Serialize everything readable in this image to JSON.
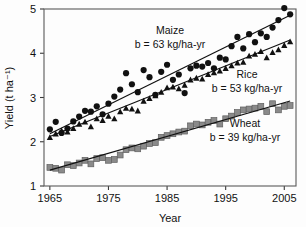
{
  "chart_data": {
    "type": "scatter",
    "title": "",
    "xlabel": "Year",
    "ylabel": "Yield (t ha⁻¹)",
    "xlim": [
      1964,
      2007
    ],
    "ylim": [
      1,
      5
    ],
    "xticks": [
      1965,
      1975,
      1985,
      1995,
      2005
    ],
    "yticks": [
      1,
      2,
      3,
      4,
      5
    ],
    "grid": false,
    "legend_position": "inline-annotations",
    "series": [
      {
        "name": "Maize",
        "marker": "circle",
        "color": "#111111",
        "slope_label": "b = 63 kg/ha-yr",
        "slope_value": 63,
        "slope_units": "kg/ha-yr",
        "trendline": {
          "x0": 1965,
          "y0": 2.18,
          "x1": 2006,
          "y1": 4.86
        },
        "x": [
          1965,
          1966,
          1967,
          1968,
          1969,
          1970,
          1971,
          1972,
          1973,
          1974,
          1975,
          1976,
          1977,
          1978,
          1979,
          1980,
          1981,
          1982,
          1983,
          1984,
          1985,
          1986,
          1987,
          1988,
          1989,
          1990,
          1991,
          1992,
          1993,
          1994,
          1995,
          1996,
          1997,
          1998,
          1999,
          2000,
          2001,
          2002,
          2003,
          2004,
          2005,
          2006
        ],
        "y": [
          2.28,
          2.45,
          2.2,
          2.3,
          2.46,
          2.57,
          2.7,
          2.68,
          2.8,
          2.62,
          2.86,
          3.02,
          3.18,
          3.55,
          3.3,
          3.12,
          3.62,
          3.46,
          3.06,
          3.58,
          3.74,
          3.4,
          3.52,
          3.1,
          3.66,
          3.72,
          3.7,
          3.78,
          3.66,
          3.9,
          3.86,
          4.16,
          4.37,
          4.11,
          4.43,
          4.25,
          4.45,
          4.37,
          4.58,
          4.75,
          5.02,
          4.88
        ]
      },
      {
        "name": "Rice",
        "marker": "triangle",
        "color": "#111111",
        "slope_label": "b = 53 kg/ha-yr",
        "slope_value": 53,
        "slope_units": "kg/ha-yr",
        "trendline": {
          "x0": 1965,
          "y0": 2.12,
          "x1": 2006,
          "y1": 4.3
        },
        "x": [
          1965,
          1966,
          1967,
          1968,
          1969,
          1970,
          1971,
          1972,
          1973,
          1974,
          1975,
          1976,
          1977,
          1978,
          1979,
          1980,
          1981,
          1982,
          1983,
          1984,
          1985,
          1986,
          1987,
          1988,
          1989,
          1990,
          1991,
          1992,
          1993,
          1994,
          1995,
          1996,
          1997,
          1998,
          1999,
          2000,
          2001,
          2002,
          2003,
          2004,
          2005,
          2006
        ],
        "y": [
          2.1,
          2.18,
          2.25,
          2.22,
          2.3,
          2.4,
          2.45,
          2.34,
          2.52,
          2.48,
          2.58,
          2.52,
          2.68,
          2.76,
          2.74,
          2.7,
          2.92,
          2.98,
          3.04,
          3.12,
          3.22,
          3.24,
          3.2,
          3.28,
          3.4,
          3.44,
          3.42,
          3.52,
          3.56,
          3.6,
          3.66,
          3.72,
          3.78,
          3.8,
          3.94,
          3.98,
          4.04,
          3.9,
          4.02,
          4.08,
          4.18,
          4.26
        ]
      },
      {
        "name": "Wheat",
        "marker": "square",
        "color": "#8a8a8a",
        "slope_label": "b = 39 kg/ha-yr",
        "slope_value": 39,
        "slope_units": "kg/ha-yr",
        "trendline": {
          "x0": 1965,
          "y0": 1.36,
          "x1": 2006,
          "y1": 2.92
        },
        "x": [
          1965,
          1966,
          1967,
          1968,
          1969,
          1970,
          1971,
          1972,
          1973,
          1974,
          1975,
          1976,
          1977,
          1978,
          1979,
          1980,
          1981,
          1982,
          1983,
          1984,
          1985,
          1986,
          1987,
          1988,
          1989,
          1990,
          1991,
          1992,
          1993,
          1994,
          1995,
          1996,
          1997,
          1998,
          1999,
          2000,
          2001,
          2002,
          2003,
          2004,
          2005,
          2006
        ],
        "y": [
          1.42,
          1.4,
          1.36,
          1.48,
          1.46,
          1.52,
          1.58,
          1.5,
          1.62,
          1.64,
          1.58,
          1.6,
          1.7,
          1.82,
          1.86,
          1.84,
          1.9,
          1.96,
          1.98,
          2.1,
          2.14,
          2.18,
          2.22,
          2.24,
          2.36,
          2.4,
          2.38,
          2.44,
          2.48,
          2.4,
          2.52,
          2.58,
          2.66,
          2.72,
          2.74,
          2.76,
          2.8,
          2.68,
          2.86,
          2.72,
          2.8,
          2.82
        ]
      }
    ],
    "annotations": [
      {
        "id": "maize",
        "name": "Maize",
        "slope": "b = 63 kg/ha-yr",
        "x": 170,
        "y": 34
      },
      {
        "id": "rice",
        "name": "Rice",
        "slope": "b = 53 kg/ha-yr",
        "x": 247,
        "y": 78
      },
      {
        "id": "wheat",
        "name": "Wheat",
        "slope": "b = 39 kg/ha-yr",
        "x": 245,
        "y": 127
      }
    ]
  },
  "axes": {
    "x_title": "Year",
    "y_title": "Yield (t ha⁻¹)",
    "x_tick_labels": [
      "1965",
      "1975",
      "1985",
      "1995",
      "2005"
    ],
    "y_tick_labels": [
      "1",
      "2",
      "3",
      "4",
      "5"
    ]
  },
  "colors": {
    "maize": "#111111",
    "rice": "#111111",
    "wheat": "#8a8a8a",
    "frame": "#5a5a5a",
    "text": "#111111",
    "background": "#fdfdfd"
  }
}
